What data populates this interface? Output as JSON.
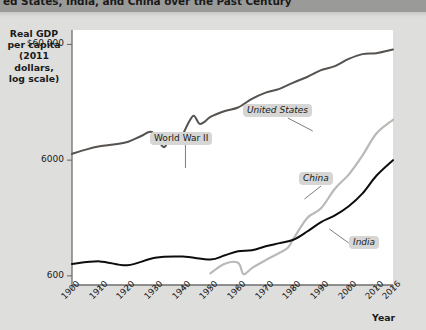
{
  "header": {
    "title": "ed States, India, and China over the Past Century"
  },
  "axis": {
    "y_title_lines": [
      "Real GDP",
      "per capita",
      "(2011 dollars,",
      "log scale)"
    ],
    "x_title": "Year"
  },
  "colors": {
    "page_background": "#dededd",
    "title_band": "#9a9a99",
    "plot_background": "#ffffff",
    "united_states": "#55524f",
    "china": "#b9b9b7",
    "india": "#0d0d0d",
    "axis": "#6e6e6c",
    "callout_background": "#d6d6d4"
  },
  "chart_data": {
    "type": "line",
    "title": "ed States, India, and China over the Past Century",
    "xlabel": "Year",
    "ylabel": "Real GDP per capita (2011 dollars, log scale)",
    "yscale": "log",
    "ylim": [
      500,
      80000
    ],
    "xlim": [
      1900,
      2016
    ],
    "grid": false,
    "legend": "inline-labels",
    "yticks": [
      "600",
      "6000",
      "$60,000"
    ],
    "ytick_values": [
      600,
      6000,
      60000
    ],
    "xticks": [
      "1900",
      "1910",
      "1920",
      "1930",
      "1940",
      "1950",
      "1960",
      "1970",
      "1980",
      "1990",
      "2000",
      "2010",
      "2016"
    ],
    "xtick_values": [
      1900,
      1910,
      1920,
      1930,
      1940,
      1950,
      1960,
      1970,
      1980,
      1990,
      2000,
      2010,
      2016
    ],
    "annotations": [
      {
        "label": "World War II",
        "x": 1941,
        "style": "leader-line-down"
      },
      {
        "label": "United States",
        "x": 1978,
        "style": "leader-line-down-right"
      },
      {
        "label": "China",
        "x": 1993,
        "style": "leader-line-down-right"
      },
      {
        "label": "India",
        "x": 2002,
        "style": "leader-line-up-left"
      }
    ],
    "series": [
      {
        "name": "United States",
        "color": "#55524f",
        "x": [
          1900,
          1905,
          1910,
          1915,
          1920,
          1925,
          1929,
          1933,
          1935,
          1938,
          1940,
          1942,
          1944,
          1946,
          1948,
          1950,
          1955,
          1960,
          1965,
          1970,
          1975,
          1980,
          1985,
          1990,
          1995,
          2000,
          2005,
          2010,
          2016
        ],
        "values": [
          6800,
          7400,
          7900,
          8200,
          8600,
          9700,
          10500,
          7800,
          8900,
          9200,
          10000,
          12500,
          14500,
          12400,
          12900,
          14200,
          15900,
          17100,
          20300,
          23000,
          24800,
          28100,
          31400,
          36000,
          39000,
          45000,
          49500,
          50400,
          54200
        ]
      },
      {
        "name": "China",
        "color": "#b9b9b7",
        "x": [
          1950,
          1955,
          1960,
          1962,
          1965,
          1970,
          1975,
          1978,
          1980,
          1985,
          1990,
          1995,
          2000,
          2005,
          2010,
          2016
        ],
        "values": [
          630,
          760,
          780,
          620,
          700,
          820,
          950,
          1050,
          1250,
          1900,
          2300,
          3400,
          4500,
          6600,
          10200,
          13400
        ]
      },
      {
        "name": "India",
        "color": "#0d0d0d",
        "x": [
          1900,
          1910,
          1920,
          1930,
          1940,
          1950,
          1955,
          1960,
          1965,
          1970,
          1975,
          1980,
          1985,
          1990,
          1995,
          2000,
          2005,
          2010,
          2016
        ],
        "values": [
          760,
          800,
          740,
          860,
          880,
          830,
          900,
          980,
          1000,
          1080,
          1150,
          1230,
          1450,
          1750,
          2000,
          2400,
          3100,
          4400,
          6000
        ]
      }
    ]
  }
}
